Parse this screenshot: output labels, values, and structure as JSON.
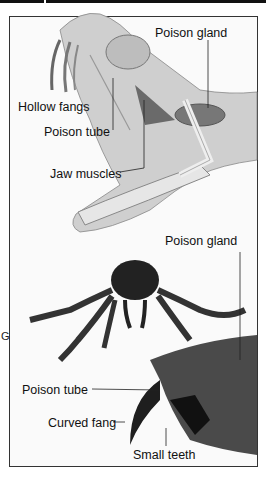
{
  "figure": {
    "snake": {
      "labels": {
        "poison_gland": "Poison gland",
        "hollow_fangs": "Hollow fangs",
        "poison_tube": "Poison tube",
        "jaw_muscles": "Jaw muscles"
      }
    },
    "spider": {
      "labels": {
        "poison_gland": "Poison gland",
        "poison_tube": "Poison tube",
        "curved_fang": "Curved fang",
        "small_teeth": "Small teeth"
      }
    },
    "edge_glyph": "G"
  }
}
